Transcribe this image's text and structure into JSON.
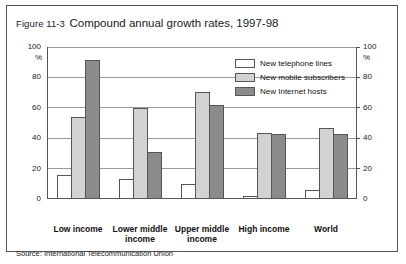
{
  "figure": {
    "number": "Figure 11-3",
    "title": "Compound annual growth rates, 1997-98",
    "source": "Source: International Telecommunication Union"
  },
  "legend": {
    "items": [
      {
        "label": "New telephone lines",
        "color": "#fdfdfd"
      },
      {
        "label": "New mobile subscribers",
        "color": "#d2d2d2"
      },
      {
        "label": "New Internet hosts",
        "color": "#8b8b8b"
      }
    ]
  },
  "axis": {
    "unit_left": "%",
    "unit_right": "%",
    "ticks": [
      "100",
      "80",
      "60",
      "40",
      "20",
      "0"
    ]
  },
  "chart_data": {
    "type": "bar",
    "title": "Compound annual growth rates, 1997-98",
    "xlabel": "",
    "ylabel": "%",
    "ylim": [
      0,
      100
    ],
    "yticks": [
      0,
      20,
      40,
      60,
      80,
      100
    ],
    "grid": true,
    "legend_position": "top-right",
    "dual_axis": true,
    "categories": [
      "Low income",
      "Lower middle income",
      "Upper middle income",
      "High income",
      "World"
    ],
    "series": [
      {
        "name": "New telephone lines",
        "color": "#fdfdfd",
        "values": [
          16,
          13,
          10,
          2,
          6
        ]
      },
      {
        "name": "New mobile subscribers",
        "color": "#d2d2d2",
        "values": [
          54,
          60,
          71,
          44,
          47
        ]
      },
      {
        "name": "New Internet hosts",
        "color": "#8b8b8b",
        "values": [
          92,
          31,
          62,
          43,
          43
        ]
      }
    ],
    "source": "Source: International Telecommunication Union"
  }
}
